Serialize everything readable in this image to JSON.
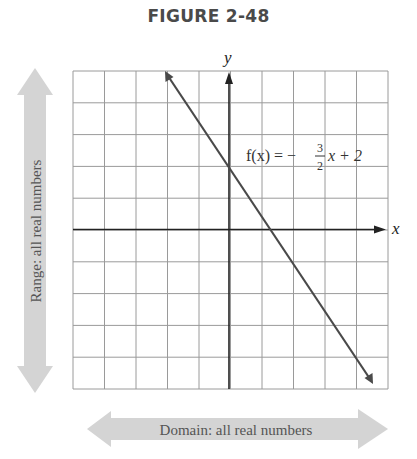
{
  "figure": {
    "title": "FIGURE 2-48"
  },
  "chart_data": {
    "type": "line",
    "title": "FIGURE 2-48",
    "xlabel": "x",
    "ylabel": "y",
    "xlim": [
      -5,
      5
    ],
    "ylim": [
      -5,
      5
    ],
    "grid": true,
    "grid_step": 1,
    "series": [
      {
        "name": "f(x) = -3/2 x + 2",
        "slope": -1.5,
        "intercept": 2,
        "x": [
          -2,
          4.5
        ],
        "y": [
          5,
          -4.75
        ],
        "color": "#4a4a4a"
      }
    ],
    "annotations": [
      {
        "text": "f(x) = -3/2 x + 2",
        "x": 0.6,
        "y": 2.3
      },
      {
        "text": "Range: all real numbers",
        "orientation": "vertical",
        "side": "left"
      },
      {
        "text": "Domain: all real numbers",
        "orientation": "horizontal",
        "side": "bottom"
      }
    ]
  },
  "labels": {
    "x_axis": "x",
    "y_axis": "y",
    "func_prefix": "f(x) = −",
    "func_num": "3",
    "func_den": "2",
    "func_suffix": "x + 2",
    "range": "Range: all real numbers",
    "domain": "Domain: all real numbers"
  },
  "colors": {
    "grid": "#9a9a9a",
    "axis": "#222222",
    "line": "#4a4a4a",
    "arrow_band": "#d4d4d4",
    "band_text": "#555555"
  }
}
